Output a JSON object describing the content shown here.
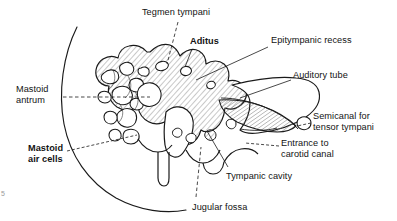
{
  "figure": {
    "kind": "anatomical-illustration",
    "background_color": "#ffffff",
    "ink_color": "#1a1a1a",
    "hatch_color": "#6e6e6e",
    "corner_mark": "5"
  },
  "labels": [
    {
      "id": "tegmen-tympani",
      "text": "Tegmen tympani",
      "bold": false,
      "align": "center",
      "x": 137,
      "y": 8
    },
    {
      "id": "aditus",
      "text": "Aditus",
      "bold": true,
      "align": "left",
      "x": 190,
      "y": 37
    },
    {
      "id": "epitympanic-recess",
      "text": "Epitympanic recess",
      "bold": false,
      "align": "left",
      "x": 271,
      "y": 36
    },
    {
      "id": "auditory-tube",
      "text": "Auditory tube",
      "bold": false,
      "align": "left",
      "x": 293,
      "y": 71
    },
    {
      "id": "mastoid-antrum",
      "text_line_1": "Mastoid",
      "text_line_2": "antrum",
      "bold": false,
      "align": "left",
      "x": 16,
      "y": 84
    },
    {
      "id": "semicanal-tensor-tympani",
      "text_line_1": "Semicanal for",
      "text_line_2": "tensor tympani",
      "bold": false,
      "align": "left",
      "x": 313,
      "y": 112
    },
    {
      "id": "mastoid-air-cells",
      "text_line_1": "Mastoid",
      "text_line_2": "air cells",
      "bold": true,
      "align": "left",
      "x": 28,
      "y": 144
    },
    {
      "id": "entrance-carotid-canal",
      "text_line_1": "Entrance to",
      "text_line_2": "carotid canal",
      "bold": false,
      "align": "left",
      "x": 281,
      "y": 138
    },
    {
      "id": "tympanic-cavity",
      "text": "Tympanic cavity",
      "bold": false,
      "align": "left",
      "x": 226,
      "y": 172
    },
    {
      "id": "jugular-fossa",
      "text": "Jugular fossa",
      "bold": false,
      "align": "left",
      "x": 192,
      "y": 203
    }
  ],
  "leaders": [
    {
      "id": "leader-tegmen-tympani",
      "style": "solid",
      "from": [
        178,
        22
      ],
      "to": [
        167,
        65
      ]
    },
    {
      "id": "leader-aditus",
      "style": "solid",
      "from": [
        194,
        49
      ],
      "to": [
        185,
        71
      ]
    },
    {
      "id": "leader-epitympanic-recess",
      "style": "solid",
      "from": [
        268,
        47
      ],
      "to": [
        196,
        81
      ]
    },
    {
      "id": "leader-auditory-tube",
      "style": "solid",
      "from": [
        291,
        80
      ],
      "to": [
        239,
        99
      ]
    },
    {
      "id": "leader-mastoid-antrum",
      "style": "dashed",
      "from": [
        63,
        97
      ],
      "to": [
        150,
        97
      ]
    },
    {
      "id": "leader-semicanal",
      "style": "dashed",
      "from": [
        311,
        123
      ],
      "to": [
        296,
        127
      ]
    },
    {
      "id": "leader-mastoid-air-cells",
      "style": "dashed",
      "from": [
        66,
        152
      ],
      "to": [
        137,
        136
      ]
    },
    {
      "id": "leader-carotid-canal",
      "style": "dashed",
      "from": [
        279,
        147
      ],
      "to": [
        246,
        143
      ]
    },
    {
      "id": "leader-tympanic-cavity",
      "style": "solid",
      "from": [
        228,
        168
      ],
      "to": [
        206,
        128
      ]
    },
    {
      "id": "leader-jugular-fossa",
      "style": "dashed",
      "from": [
        196,
        198
      ],
      "to": [
        201,
        146
      ]
    }
  ]
}
